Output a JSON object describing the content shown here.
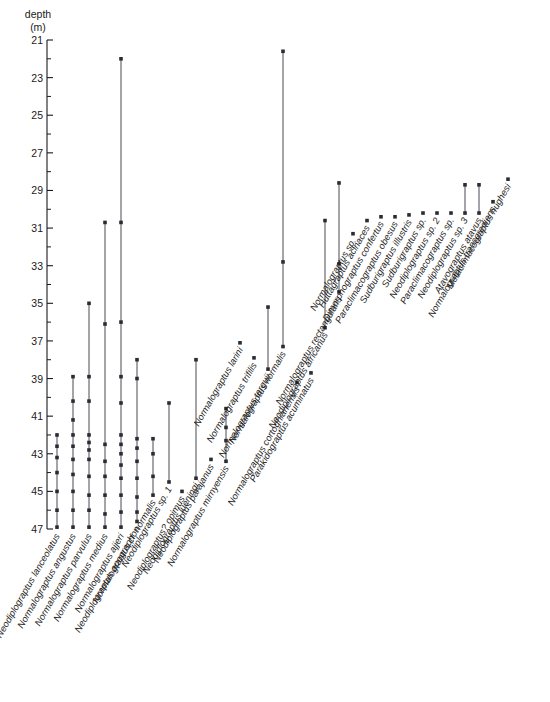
{
  "axis": {
    "title_line1": "depth",
    "title_line2": "(m)",
    "unit": "m",
    "min": 21,
    "max": 47,
    "tick_labels": [
      "21",
      "23",
      "25",
      "27",
      "29",
      "31",
      "33",
      "35",
      "37",
      "39",
      "41",
      "43",
      "45",
      "47"
    ],
    "tick_step_major": 2,
    "tick_step_minor": 1,
    "direction": "depth-increases-downward"
  },
  "chart_data": {
    "type": "scatter",
    "title": "",
    "xlabel": "",
    "ylabel": "depth (m)",
    "ylim": [
      21,
      47
    ],
    "y_inverted": true,
    "grid": false,
    "legend": "none",
    "categories": [
      "Neodiplograptus lanceolatus",
      "Normalograptus angustus",
      "Normalograptus parvulus",
      "Normalograptus medius",
      "Normalograptus ajjeri",
      "Neodiplograptus apographon",
      "Normalograptus cf. normalis",
      "Neodiplograptus sp. 1",
      "Neodiplograptus? opimus",
      "Neodiplograptus lueningi",
      "Neodiplograptus parajanus",
      "Normalograptus mirnyensis",
      "Normalograptus larini",
      "Normalograptus trifilis",
      "Normalograptus targuii",
      "Normalograptus normalis",
      "Normalograptus cortoghianensis",
      "Parakidograptus acuminatus",
      "Neodiplograptus africanus",
      "Normalograptus rectangularis",
      "Normalograptus sp.",
      "Huttagraptus acinaces",
      "Dimorphograptus confertus",
      "Paraclimacograptus obesus",
      "Sudburigraptus illustris",
      "Sudburigraptus sp.",
      "Neodiplograptus sp. 2",
      "Paraclimacograptus sp.",
      "Neodiplograptus sp. 3",
      "Atavograptus atavus",
      "Normalograptus transgrediens",
      "Metaclimacograptus hughesi"
    ],
    "taxa": [
      {
        "name": "Neodiplograptus lanceolatus",
        "x": 57,
        "top": 42.0,
        "bottom": 47.0,
        "occurrences": [
          42.0,
          42.6,
          43.2,
          44.0,
          45.0,
          46.0,
          46.9
        ]
      },
      {
        "name": "Normalograptus angustus",
        "x": 73,
        "top": 38.9,
        "bottom": 47.0,
        "occurrences": [
          38.9,
          40.2,
          41.2,
          42.0,
          42.6,
          43.3,
          44.1,
          45.0,
          46.0,
          46.9
        ]
      },
      {
        "name": "Normalograptus parvulus",
        "x": 89,
        "top": 35.0,
        "bottom": 47.0,
        "occurrences": [
          35.0,
          38.9,
          40.2,
          42.0,
          42.4,
          42.8,
          43.3,
          44.2,
          45.2,
          46.0,
          46.9
        ]
      },
      {
        "name": "Normalograptus medius",
        "x": 105,
        "top": 30.7,
        "bottom": 47.0,
        "occurrences": [
          30.7,
          36.1,
          42.5,
          43.4,
          44.2,
          45.2,
          46.2,
          46.9
        ]
      },
      {
        "name": "Normalograptus ajjeri",
        "x": 121,
        "top": 22.0,
        "bottom": 47.0,
        "occurrences": [
          22.0,
          30.7,
          36.0,
          38.9,
          40.3,
          42.0,
          42.5,
          43.0,
          43.6,
          44.3,
          45.2,
          46.1,
          46.9
        ]
      },
      {
        "name": "Neodiplograptus apographon",
        "x": 137,
        "top": 38.0,
        "bottom": 46.6,
        "occurrences": [
          38.0,
          39.0,
          42.2,
          42.7,
          43.4,
          44.3,
          45.3,
          46.1,
          46.6
        ]
      },
      {
        "name": "Normalograptus cf. normalis",
        "x": 153,
        "top": 42.2,
        "bottom": 45.2,
        "occurrences": [
          42.2,
          43.0,
          44.2,
          45.2
        ]
      },
      {
        "name": "Neodiplograptus sp. 1",
        "x": 169,
        "top": 40.3,
        "bottom": 44.5,
        "occurrences": [
          40.3,
          44.5
        ]
      },
      {
        "name": "Neodiplograptus? opimus",
        "x": 182,
        "top": 45.0,
        "bottom": 45.0,
        "occurrences": [
          45.0
        ]
      },
      {
        "name": "Neodiplograptus lueningi",
        "x": 196,
        "top": 38.0,
        "bottom": 44.3,
        "occurrences": [
          38.0,
          44.3
        ]
      },
      {
        "name": "Neodiplograptus parajanus",
        "x": 211,
        "top": 43.3,
        "bottom": 43.3,
        "occurrences": [
          43.3
        ]
      },
      {
        "name": "Normalograptus mirnyensis",
        "x": 226,
        "top": 40.6,
        "bottom": 43.4,
        "occurrences": [
          40.6,
          41.6,
          42.3,
          43.4
        ]
      },
      {
        "name": "Normalograptus larini",
        "x": 240,
        "top": 37.1,
        "bottom": 37.1,
        "occurrences": [
          37.1
        ]
      },
      {
        "name": "Normalograptus trifilis",
        "x": 254,
        "top": 37.9,
        "bottom": 37.9,
        "occurrences": [
          37.9
        ]
      },
      {
        "name": "Normalograptus targuii",
        "x": 268,
        "top": 35.2,
        "bottom": 38.5,
        "occurrences": [
          35.2,
          38.5
        ]
      },
      {
        "name": "Normalograptus normalis",
        "x": 283,
        "top": 21.6,
        "bottom": 37.3,
        "occurrences": [
          21.6,
          32.8,
          37.3
        ]
      },
      {
        "name": "Normalograptus cortoghianensis",
        "x": 297,
        "top": 39.2,
        "bottom": 39.2,
        "occurrences": [
          39.2
        ]
      },
      {
        "name": "Parakidograptus acuminatus",
        "x": 311,
        "top": 38.7,
        "bottom": 38.7,
        "occurrences": [
          38.7
        ]
      },
      {
        "name": "Neodiplograptus africanus",
        "x": 325,
        "top": 30.6,
        "bottom": 36.3,
        "occurrences": [
          30.6,
          36.3
        ]
      },
      {
        "name": "Normalograptus rectangularis",
        "x": 339,
        "top": 28.6,
        "bottom": 34.4,
        "occurrences": [
          28.6,
          32.9,
          34.4
        ]
      },
      {
        "name": "Normalograptus sp.",
        "x": 353,
        "top": 31.3,
        "bottom": 31.3,
        "occurrences": [
          31.3
        ]
      },
      {
        "name": "Huttagraptus acinaces",
        "x": 367,
        "top": 30.6,
        "bottom": 30.6,
        "occurrences": [
          30.6
        ]
      },
      {
        "name": "Dimorphograptus confertus",
        "x": 381,
        "top": 30.4,
        "bottom": 30.4,
        "occurrences": [
          30.4
        ]
      },
      {
        "name": "Paraclimacograptus obesus",
        "x": 395,
        "top": 30.4,
        "bottom": 30.4,
        "occurrences": [
          30.4
        ]
      },
      {
        "name": "Sudburigraptus illustris",
        "x": 409,
        "top": 30.3,
        "bottom": 30.3,
        "occurrences": [
          30.3
        ]
      },
      {
        "name": "Sudburigraptus sp.",
        "x": 423,
        "top": 30.2,
        "bottom": 30.2,
        "occurrences": [
          30.2
        ]
      },
      {
        "name": "Neodiplograptus sp. 2",
        "x": 437,
        "top": 30.2,
        "bottom": 30.2,
        "occurrences": [
          30.2
        ]
      },
      {
        "name": "Paraclimacograptus sp.",
        "x": 451,
        "top": 30.2,
        "bottom": 30.2,
        "occurrences": [
          30.2
        ]
      },
      {
        "name": "Neodiplograptus sp. 3",
        "x": 465,
        "top": 28.7,
        "bottom": 30.2,
        "occurrences": [
          28.7,
          30.2
        ]
      },
      {
        "name": "Atavograptus atavus",
        "x": 479,
        "top": 28.7,
        "bottom": 30.2,
        "occurrences": [
          28.7,
          30.2
        ]
      },
      {
        "name": "Normalograptus transgrediens",
        "x": 493,
        "top": 29.6,
        "bottom": 29.6,
        "occurrences": [
          29.6
        ]
      },
      {
        "name": "Metaclimacograptus hughesi",
        "x": 508,
        "top": 28.4,
        "bottom": 28.4,
        "occurrences": [
          28.4
        ]
      }
    ]
  },
  "colors": {
    "ink": "#1a1a1a",
    "bar": "#4a4a52",
    "dot": "#2b2b33",
    "background": "#ffffff"
  }
}
